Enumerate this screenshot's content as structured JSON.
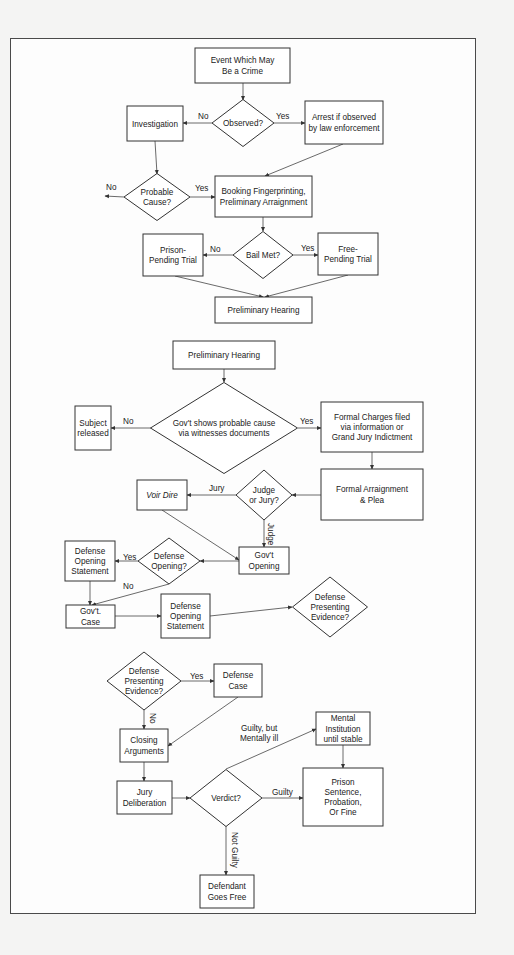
{
  "colors": {
    "stroke": "#333333",
    "background": "#f4f4f3",
    "frame_fill": "#fdfdfd",
    "text": "#222222"
  },
  "nodes": [
    {
      "id": "event",
      "type": "box",
      "x": 195,
      "y": 48,
      "w": 95,
      "h": 35,
      "lines": [
        "Event Which May",
        "Be a Crime"
      ]
    },
    {
      "id": "observed",
      "type": "diamond",
      "cx": 243,
      "cy": 123,
      "w": 62,
      "h": 47,
      "lines": [
        "Observed?"
      ]
    },
    {
      "id": "investigation",
      "type": "box",
      "x": 127,
      "y": 106,
      "w": 56,
      "h": 35,
      "lines": [
        "Investigation"
      ]
    },
    {
      "id": "arrest",
      "type": "box",
      "x": 305,
      "y": 101,
      "w": 78,
      "h": 43,
      "lines": [
        "Arrest if observed",
        "by law enforcement"
      ]
    },
    {
      "id": "probable",
      "type": "diamond",
      "cx": 157,
      "cy": 197,
      "w": 66,
      "h": 47,
      "lines": [
        "Probable",
        "Cause?"
      ]
    },
    {
      "id": "booking",
      "type": "box",
      "x": 215,
      "y": 176,
      "w": 97,
      "h": 41,
      "lines": [
        "Booking Fingerprinting,",
        "Preliminary Arraignment"
      ]
    },
    {
      "id": "bail",
      "type": "diamond",
      "cx": 263,
      "cy": 255,
      "w": 60,
      "h": 47,
      "lines": [
        "Bail Met?"
      ]
    },
    {
      "id": "prison_pending",
      "type": "box",
      "x": 143,
      "y": 234,
      "w": 60,
      "h": 42,
      "lines": [
        "Prison-",
        "Pending Trial"
      ]
    },
    {
      "id": "free_pending",
      "type": "box",
      "x": 318,
      "y": 233,
      "w": 60,
      "h": 42,
      "lines": [
        "Free-",
        "Pending Trial"
      ]
    },
    {
      "id": "prelim1",
      "type": "box",
      "x": 215,
      "y": 297,
      "w": 97,
      "h": 26,
      "lines": [
        "Preliminary Hearing"
      ]
    },
    {
      "id": "prelim2",
      "type": "box",
      "x": 173,
      "y": 341,
      "w": 102,
      "h": 28,
      "lines": [
        "Preliminary Hearing"
      ]
    },
    {
      "id": "govt_shows",
      "type": "diamond",
      "cx": 224,
      "cy": 428,
      "w": 147,
      "h": 91,
      "lines": [
        "Gov't shows probable cause",
        "via witnesses documents"
      ]
    },
    {
      "id": "subject_released",
      "type": "box",
      "x": 75,
      "y": 406,
      "w": 36,
      "h": 44,
      "lines": [
        "Subject",
        "released"
      ]
    },
    {
      "id": "formal_charges",
      "type": "box",
      "x": 321,
      "y": 402,
      "w": 102,
      "h": 50,
      "lines": [
        "Formal Charges filed",
        "via information or",
        "Grand Jury Indictment"
      ]
    },
    {
      "id": "formal_arraignment",
      "type": "box",
      "x": 321,
      "y": 469,
      "w": 102,
      "h": 51,
      "lines": [
        "Formal Arraignment",
        "& Plea"
      ]
    },
    {
      "id": "judge_or_jury",
      "type": "diamond",
      "cx": 264,
      "cy": 495,
      "w": 56,
      "h": 50,
      "lines": [
        "Judge",
        "or Jury?"
      ]
    },
    {
      "id": "voir_dire",
      "type": "box",
      "x": 137,
      "y": 480,
      "w": 50,
      "h": 30,
      "lines": [
        "Voir Dire"
      ],
      "italic": true
    },
    {
      "id": "govt_opening",
      "type": "box",
      "x": 239,
      "y": 547,
      "w": 50,
      "h": 27,
      "lines": [
        "Gov't",
        "Opening"
      ]
    },
    {
      "id": "defense_opening_q",
      "type": "diamond",
      "cx": 169,
      "cy": 561,
      "w": 62,
      "h": 46,
      "lines": [
        "Defense",
        "Opening?"
      ]
    },
    {
      "id": "defense_opening_stmt_1",
      "type": "box",
      "x": 65,
      "y": 541,
      "w": 50,
      "h": 40,
      "lines": [
        "Defense",
        "Opening",
        "Statement"
      ]
    },
    {
      "id": "govt_case",
      "type": "box",
      "x": 66,
      "y": 605,
      "w": 49,
      "h": 23,
      "lines": [
        "Gov't.",
        "Case"
      ]
    },
    {
      "id": "defense_opening_stmt_2",
      "type": "box",
      "x": 161,
      "y": 594,
      "w": 49,
      "h": 44,
      "lines": [
        "Defense",
        "Opening",
        "Statement"
      ]
    },
    {
      "id": "defense_presenting_1",
      "type": "diamond",
      "cx": 330,
      "cy": 607,
      "w": 75,
      "h": 60,
      "lines": [
        "Defense",
        "Presenting",
        "Evidence?"
      ]
    },
    {
      "id": "defense_presenting_2",
      "type": "diamond",
      "cx": 144,
      "cy": 681,
      "w": 74,
      "h": 58,
      "lines": [
        "Defense",
        "Presenting",
        "Evidence?"
      ]
    },
    {
      "id": "defense_case",
      "type": "box",
      "x": 214,
      "y": 664,
      "w": 48,
      "h": 33,
      "lines": [
        "Defense",
        "Case"
      ]
    },
    {
      "id": "closing",
      "type": "box",
      "x": 120,
      "y": 729,
      "w": 48,
      "h": 33,
      "lines": [
        "Closing",
        "Arguments"
      ]
    },
    {
      "id": "jury_deliberation",
      "type": "box",
      "x": 117,
      "y": 781,
      "w": 55,
      "h": 33,
      "lines": [
        "Jury",
        "Deliberation"
      ]
    },
    {
      "id": "verdict",
      "type": "diamond",
      "cx": 226,
      "cy": 798,
      "w": 72,
      "h": 57,
      "lines": [
        "Verdict?"
      ]
    },
    {
      "id": "mental_institution",
      "type": "box",
      "x": 316,
      "y": 712,
      "w": 54,
      "h": 33,
      "lines": [
        "Mental",
        "Institution",
        "until stable"
      ]
    },
    {
      "id": "prison_sentence",
      "type": "box",
      "x": 303,
      "y": 768,
      "w": 80,
      "h": 58,
      "lines": [
        "Prison",
        "Sentence,",
        "Probation,",
        "Or Fine"
      ]
    },
    {
      "id": "defendant_free",
      "type": "box",
      "x": 200,
      "y": 875,
      "w": 54,
      "h": 33,
      "lines": [
        "Defendant",
        "Goes Free"
      ]
    }
  ],
  "edges": [
    {
      "pts": [
        [
          243,
          83
        ],
        [
          243,
          100
        ]
      ]
    },
    {
      "pts": [
        [
          212,
          123
        ],
        [
          183,
          123
        ]
      ]
    },
    {
      "pts": [
        [
          274,
          123
        ],
        [
          305,
          123
        ]
      ]
    },
    {
      "pts": [
        [
          155,
          141
        ],
        [
          157,
          174
        ]
      ]
    },
    {
      "pts": [
        [
          343,
          144
        ],
        [
          265,
          176
        ]
      ]
    },
    {
      "pts": [
        [
          124,
          197
        ],
        [
          105,
          196
        ]
      ]
    },
    {
      "pts": [
        [
          190,
          197
        ],
        [
          215,
          197
        ]
      ]
    },
    {
      "pts": [
        [
          263,
          217
        ],
        [
          263,
          231
        ]
      ]
    },
    {
      "pts": [
        [
          233,
          255
        ],
        [
          203,
          255
        ]
      ]
    },
    {
      "pts": [
        [
          293,
          255
        ],
        [
          318,
          255
        ]
      ]
    },
    {
      "pts": [
        [
          175,
          276
        ],
        [
          263,
          297
        ]
      ]
    },
    {
      "pts": [
        [
          348,
          275
        ],
        [
          265,
          297
        ]
      ]
    },
    {
      "pts": [
        [
          224,
          369
        ],
        [
          224,
          382
        ]
      ]
    },
    {
      "pts": [
        [
          151,
          428
        ],
        [
          111,
          428
        ]
      ]
    },
    {
      "pts": [
        [
          298,
          428
        ],
        [
          321,
          428
        ]
      ]
    },
    {
      "pts": [
        [
          372,
          452
        ],
        [
          372,
          469
        ]
      ]
    },
    {
      "pts": [
        [
          321,
          495
        ],
        [
          292,
          495
        ]
      ]
    },
    {
      "pts": [
        [
          236,
          495
        ],
        [
          187,
          495
        ]
      ]
    },
    {
      "pts": [
        [
          264,
          520
        ],
        [
          264,
          547
        ]
      ]
    },
    {
      "pts": [
        [
          162,
          510
        ],
        [
          239,
          560
        ]
      ]
    },
    {
      "pts": [
        [
          239,
          561
        ],
        [
          200,
          561
        ]
      ]
    },
    {
      "pts": [
        [
          138,
          561
        ],
        [
          115,
          561
        ]
      ]
    },
    {
      "pts": [
        [
          90,
          581
        ],
        [
          90,
          605
        ]
      ]
    },
    {
      "pts": [
        [
          169,
          584
        ],
        [
          92,
          605
        ]
      ]
    },
    {
      "pts": [
        [
          115,
          616
        ],
        [
          161,
          616
        ]
      ]
    },
    {
      "pts": [
        [
          210,
          616
        ],
        [
          292,
          607
        ]
      ]
    },
    {
      "pts": [
        [
          181,
          681
        ],
        [
          214,
          681
        ]
      ]
    },
    {
      "pts": [
        [
          144,
          710
        ],
        [
          144,
          729
        ]
      ]
    },
    {
      "pts": [
        [
          238,
          697
        ],
        [
          168,
          746
        ]
      ]
    },
    {
      "pts": [
        [
          144,
          762
        ],
        [
          144,
          781
        ]
      ]
    },
    {
      "pts": [
        [
          172,
          798
        ],
        [
          190,
          798
        ]
      ]
    },
    {
      "pts": [
        [
          226,
          769
        ],
        [
          316,
          729
        ]
      ]
    },
    {
      "pts": [
        [
          343,
          745
        ],
        [
          343,
          768
        ]
      ]
    },
    {
      "pts": [
        [
          262,
          798
        ],
        [
          303,
          798
        ]
      ]
    },
    {
      "pts": [
        [
          226,
          826
        ],
        [
          226,
          875
        ]
      ]
    }
  ],
  "edge_labels": [
    {
      "text": "No",
      "x": 198,
      "y": 119
    },
    {
      "text": "Yes",
      "x": 276,
      "y": 119
    },
    {
      "text": "No",
      "x": 106,
      "y": 190
    },
    {
      "text": "Yes",
      "x": 195,
      "y": 191
    },
    {
      "text": "No",
      "x": 210,
      "y": 252
    },
    {
      "text": "Yes",
      "x": 301,
      "y": 251
    },
    {
      "text": "No",
      "x": 123,
      "y": 424
    },
    {
      "text": "Yes",
      "x": 300,
      "y": 424
    },
    {
      "text": "Jury",
      "x": 209,
      "y": 491
    },
    {
      "text": "Judge",
      "x": 268,
      "y": 523,
      "vertical": true
    },
    {
      "text": "Yes",
      "x": 123,
      "y": 560
    },
    {
      "text": "No",
      "x": 123,
      "y": 589
    },
    {
      "text": "Yes",
      "x": 190,
      "y": 679
    },
    {
      "text": "No",
      "x": 150,
      "y": 713,
      "vertical": true
    },
    {
      "text": "Guilty, but",
      "x": 241,
      "y": 731
    },
    {
      "text": "Mentally ill",
      "x": 240,
      "y": 741
    },
    {
      "text": "Guilty",
      "x": 272,
      "y": 795
    },
    {
      "text": "Not Guilty",
      "x": 232,
      "y": 832,
      "vertical": true
    }
  ]
}
